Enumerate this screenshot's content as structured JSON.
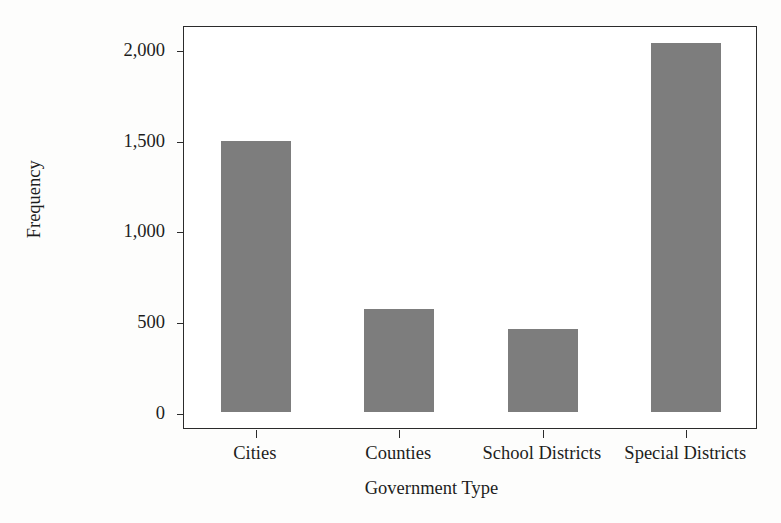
{
  "chart_data": {
    "type": "bar",
    "title": "",
    "xlabel": "Government Type",
    "ylabel": "Frequency",
    "categories": [
      "Cities",
      "Counties",
      "School Districts",
      "Special Districts"
    ],
    "values": [
      1490,
      565,
      458,
      2030
    ],
    "ylim": [
      0,
      2150
    ],
    "yticks": [
      0,
      500,
      1000,
      1500,
      2000
    ],
    "ytick_labels": [
      "0",
      "500",
      "1,000",
      "1,500",
      "2,000"
    ],
    "grid": false,
    "legend": null,
    "bar_color": "#7d7d7d",
    "axis_color": "#2b2b2b",
    "background_color": "#ffffff"
  },
  "axes": {
    "y_title": "Frequency",
    "x_title": "Government Type"
  }
}
